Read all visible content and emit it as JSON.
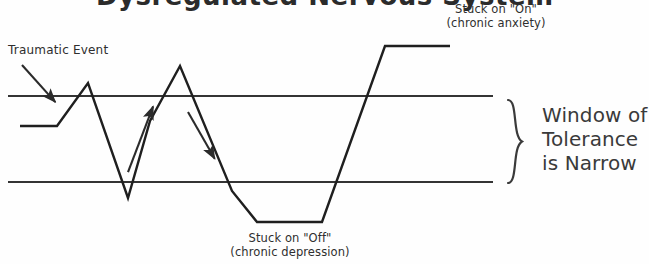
{
  "figure": {
    "title_partial": "Dysregulated Nervous System",
    "background_color": "#fefefe",
    "ink_color": "#2e2e2e"
  },
  "labels": {
    "traumatic_event": "Traumatic Event",
    "stuck_on_line1": "Stuck on \"On\"",
    "stuck_on_line2": "(chronic anxiety)",
    "stuck_off_line1": "Stuck on \"Off\"",
    "stuck_off_line2": "(chronic depression)",
    "window_line1": "Window of",
    "window_line2": "Tolerance",
    "window_line3": "is Narrow"
  },
  "chart_data": {
    "type": "line",
    "title": "Dysregulated Nervous System",
    "xlabel": "",
    "ylabel": "",
    "grid": false,
    "legend_position": "none",
    "axis_ranges": {
      "x": [
        0,
        649
      ],
      "y": [
        0,
        264
      ]
    },
    "bands": [
      {
        "name": "window-of-tolerance-upper-bound",
        "y": 96,
        "x_start": 8,
        "x_end": 493
      },
      {
        "name": "window-of-tolerance-lower-bound",
        "y": 182,
        "x_start": 8,
        "x_end": 493
      }
    ],
    "series": [
      {
        "name": "nervous-system-arousal",
        "points": [
          [
            20,
            126
          ],
          [
            57,
            126
          ],
          [
            88,
            83
          ],
          [
            128,
            198
          ],
          [
            150,
            121
          ],
          [
            180,
            66
          ],
          [
            232,
            191
          ],
          [
            257,
            222
          ],
          [
            322,
            222
          ],
          [
            385,
            46
          ],
          [
            450,
            46
          ]
        ]
      }
    ],
    "annotations": [
      {
        "name": "traumatic-event-arrow",
        "type": "arrow",
        "from": [
          22,
          65
        ],
        "to": [
          57,
          104
        ]
      },
      {
        "name": "hyperarousal-arrow",
        "type": "arrow",
        "from": [
          128,
          172
        ],
        "to": [
          154,
          104
        ]
      },
      {
        "name": "hypoarousal-arrow",
        "type": "arrow",
        "from": [
          188,
          112
        ],
        "to": [
          216,
          161
        ]
      },
      {
        "name": "window-of-tolerance-brace",
        "type": "brace",
        "y_top": 100,
        "y_bottom": 183,
        "x": 510
      }
    ]
  }
}
